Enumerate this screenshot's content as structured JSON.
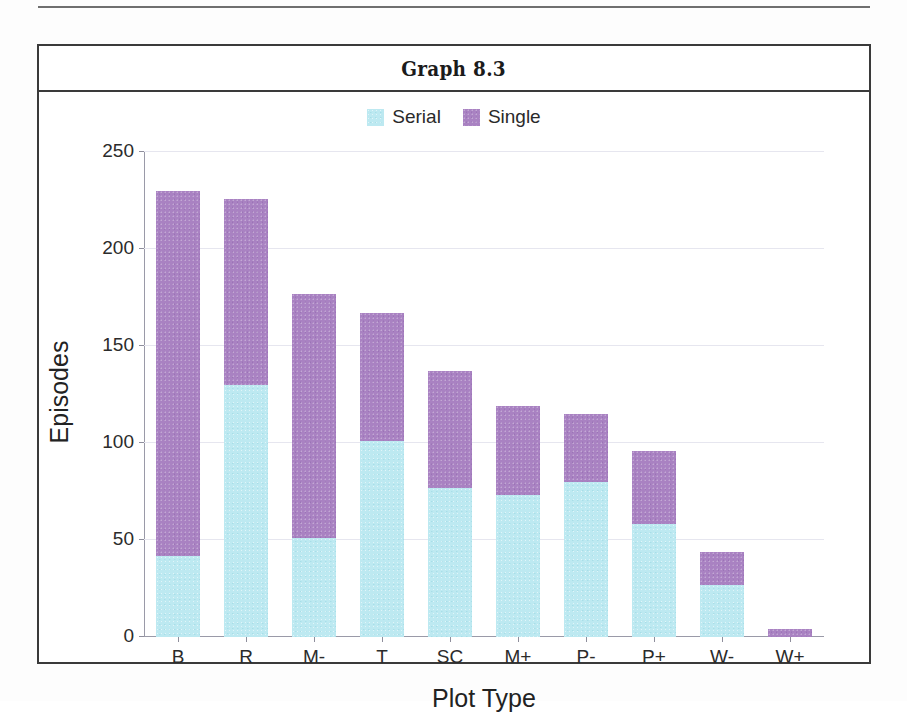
{
  "figure": {
    "title": "Graph 8.3"
  },
  "legend": {
    "position": "top-center",
    "entries": [
      {
        "label": "Serial",
        "color": "#bde9f1",
        "swatch_name": "legend-swatch-serial"
      },
      {
        "label": "Single",
        "color": "#a982c2",
        "swatch_name": "legend-swatch-single"
      }
    ]
  },
  "chart_data": {
    "type": "bar",
    "subtype": "stacked",
    "title": "Graph 8.3",
    "xlabel": "Plot Type",
    "ylabel": "Episodes",
    "categories": [
      "B",
      "R",
      "M-",
      "T",
      "SC",
      "M+",
      "P-",
      "P+",
      "W-",
      "W+"
    ],
    "series": [
      {
        "name": "Serial",
        "color": "#bde9f1",
        "values": [
          42,
          130,
          51,
          101,
          77,
          73,
          80,
          58,
          27,
          0
        ]
      },
      {
        "name": "Single",
        "color": "#a982c2",
        "values": [
          188,
          96,
          126,
          66,
          60,
          46,
          35,
          38,
          17,
          4
        ]
      }
    ],
    "totals": [
      230,
      226,
      177,
      167,
      137,
      119,
      115,
      96,
      44,
      4
    ],
    "ylim": [
      0,
      250
    ],
    "yticks": [
      0,
      50,
      100,
      150,
      200,
      250
    ],
    "ytick_labels": [
      "0",
      "50",
      "100",
      "150",
      "200",
      "250"
    ],
    "grid": true,
    "grid_axis": "y",
    "legend_position": "top-center"
  }
}
